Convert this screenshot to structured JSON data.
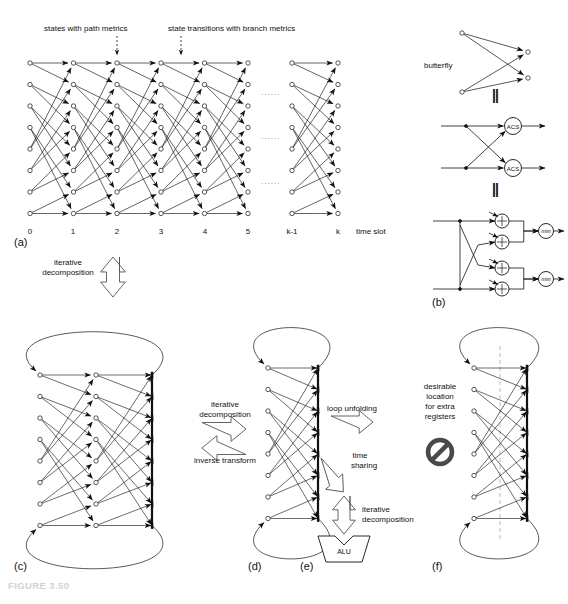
{
  "figure": {
    "caption": "FIGURE 3.50",
    "caption_color": "#d2d2d2"
  },
  "panels": {
    "a": {
      "id": "(a)",
      "annotations": [
        {
          "name": "states-with-path-metrics",
          "text": "states with path metrics"
        },
        {
          "name": "state-transitions-with-branch-metrics",
          "text": "state transitions with branch metrics"
        }
      ],
      "axis_label": "time slot",
      "time_slots": [
        "0",
        "1",
        "2",
        "3",
        "4",
        "5",
        "k-1",
        "k"
      ],
      "num_states": 8,
      "ellipsis": "......"
    },
    "b": {
      "id": "(b)",
      "butterfly_label": "butterfly",
      "equals": "||",
      "acs_label": "ACS",
      "adder_label": "+",
      "min_label": "min",
      "acs_count": 2,
      "adder_count": 4,
      "min_count": 2
    },
    "c": {
      "id": "(c)"
    },
    "d": {
      "id": "(d)"
    },
    "e": {
      "id": "(e)",
      "alu_label": "ALU"
    },
    "f": {
      "id": "(f)",
      "note_lines": [
        "desirable",
        "location",
        "for extra",
        "registers"
      ],
      "forbidden_icon": "no-entry-icon"
    }
  },
  "transforms": [
    {
      "name": "iterative-decomposition-a-to-c",
      "lines": [
        "iterative",
        "decomposition"
      ],
      "direction": "down"
    },
    {
      "name": "iterative-decomposition-c-to-d",
      "lines": [
        "iterative",
        "decomposition"
      ],
      "direction": "right"
    },
    {
      "name": "inverse-transform-d-to-c",
      "lines": [
        "inverse transform"
      ],
      "direction": "left"
    },
    {
      "name": "loop-unfolding-d-to-f",
      "lines": [
        "loop unfolding"
      ],
      "direction": "right"
    },
    {
      "name": "time-sharing-d-to-e",
      "lines": [
        "time",
        "sharing"
      ],
      "direction": "down-right"
    },
    {
      "name": "iterative-decomposition-to-alu",
      "lines": [
        "iterative",
        "decomposition"
      ],
      "direction": "down"
    }
  ],
  "colors": {
    "ink": "#111111",
    "paper": "#ffffff",
    "caption": "#d2d2d2",
    "forbidden": "#4a4a4a",
    "dash": "#b4b4b4"
  }
}
